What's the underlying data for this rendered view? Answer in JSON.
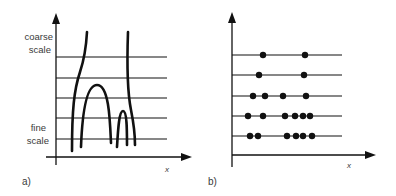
{
  "panel_a": {
    "label": "a)",
    "y_label_top_1": "coarse",
    "y_label_top_2": "scale",
    "y_label_bottom_1": "fine",
    "y_label_bottom_2": "scale",
    "x_label": "x",
    "scale_lines_y": [
      57,
      78,
      98,
      118,
      139
    ],
    "curves": [
      {
        "name": "left-zero-crossing-curve",
        "d": "M 87 32 C 86 50, 84 60, 80 72 C 74 90, 72 110, 72 151"
      },
      {
        "name": "right-zero-crossing-curve",
        "d": "M 128 32 C 127 60, 127 90, 131 110 C 134 125, 135 135, 135 145"
      },
      {
        "name": "large-arch-curve",
        "d": "M 81 147 C 82 120, 85 85, 97 85 C 109 85, 110 120, 111 143"
      },
      {
        "name": "small-arch-curve",
        "d": "M 117 147 C 118 130, 119 111, 123 111 C 127 111, 127 130, 127 145"
      }
    ]
  },
  "panel_b": {
    "label": "b)",
    "x_label": "x",
    "scale_lines_y": [
      55,
      75,
      96,
      116,
      136
    ],
    "dots": [
      {
        "y": 55,
        "x": [
          263,
          305
        ]
      },
      {
        "y": 75,
        "x": [
          259,
          304
        ]
      },
      {
        "y": 96,
        "x": [
          253,
          265,
          283,
          306
        ]
      },
      {
        "y": 116,
        "x": [
          248,
          263,
          285,
          295,
          303,
          310
        ]
      },
      {
        "y": 136,
        "x": [
          250,
          258,
          287,
          296,
          303,
          312
        ]
      }
    ]
  }
}
